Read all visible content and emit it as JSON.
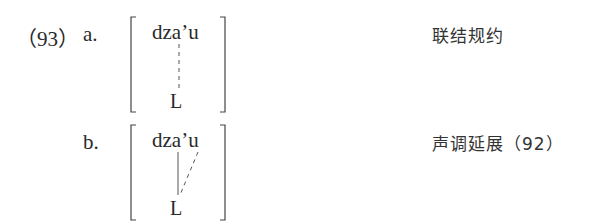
{
  "example": {
    "number": "（93）",
    "items": [
      {
        "label": "a.",
        "form": "dza’u",
        "tone": "L",
        "association": "dashed",
        "gloss": "联结规约"
      },
      {
        "label": "b.",
        "form": "dza’u",
        "tone": "L",
        "association": "solid-plus-dashed",
        "gloss": "声调延展（92）"
      }
    ]
  }
}
